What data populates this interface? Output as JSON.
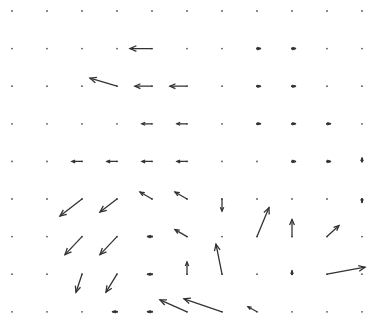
{
  "chart_data": {
    "type": "quiver",
    "title": "",
    "xlabel": "",
    "ylabel": "",
    "grid": false,
    "axes_visible": false,
    "legend": "none",
    "color": "#333333",
    "x": [
      0,
      1,
      2,
      3,
      4,
      5,
      6,
      7,
      8,
      9,
      10
    ],
    "y": [
      0,
      1,
      2,
      3,
      4,
      5,
      6,
      7,
      8
    ],
    "y_direction": "top-to-bottom",
    "vectors": [
      {
        "i": 4,
        "j": 1,
        "u": -22,
        "v": 0
      },
      {
        "i": 7,
        "j": 1,
        "u": 3,
        "v": 0
      },
      {
        "i": 8,
        "j": 1,
        "u": 3,
        "v": 0
      },
      {
        "i": 3,
        "j": 2,
        "u": -27,
        "v": 8
      },
      {
        "i": 4,
        "j": 2,
        "u": -17,
        "v": 0
      },
      {
        "i": 5,
        "j": 2,
        "u": -17,
        "v": 0
      },
      {
        "i": 7,
        "j": 2,
        "u": 3,
        "v": 0
      },
      {
        "i": 8,
        "j": 2,
        "u": 3,
        "v": 0
      },
      {
        "i": 4,
        "j": 3,
        "u": -10,
        "v": 0
      },
      {
        "i": 5,
        "j": 3,
        "u": -10,
        "v": 0
      },
      {
        "i": 7,
        "j": 3,
        "u": 3,
        "v": 0
      },
      {
        "i": 8,
        "j": 3,
        "u": 3,
        "v": 0
      },
      {
        "i": 9,
        "j": 3,
        "u": 3,
        "v": 0
      },
      {
        "i": 2,
        "j": 4,
        "u": -10,
        "v": 0
      },
      {
        "i": 3,
        "j": 4,
        "u": -10,
        "v": 0
      },
      {
        "i": 4,
        "j": 4,
        "u": -10,
        "v": 0
      },
      {
        "i": 5,
        "j": 4,
        "u": -10,
        "v": 0
      },
      {
        "i": 8,
        "j": 4,
        "u": 3,
        "v": 0
      },
      {
        "i": 9,
        "j": 4,
        "u": 3,
        "v": 0
      },
      {
        "i": 10,
        "j": 4,
        "u": 0,
        "v": 3
      },
      {
        "i": 2,
        "j": 5,
        "u": -22,
        "v": -17
      },
      {
        "i": 3,
        "j": 5,
        "u": -17,
        "v": -13
      },
      {
        "i": 4,
        "j": 5,
        "u": -12,
        "v": 7
      },
      {
        "i": 5,
        "j": 5,
        "u": -12,
        "v": 7
      },
      {
        "i": 6,
        "j": 5,
        "u": 0,
        "v": -12
      },
      {
        "i": 10,
        "j": 5,
        "u": 0,
        "v": -3
      },
      {
        "i": 2,
        "j": 6,
        "u": -17,
        "v": -18
      },
      {
        "i": 3,
        "j": 6,
        "u": -17,
        "v": -18
      },
      {
        "i": 4,
        "j": 6,
        "u": -4,
        "v": 0
      },
      {
        "i": 5,
        "j": 6,
        "u": -12,
        "v": 7
      },
      {
        "i": 7,
        "j": 6,
        "u": 12,
        "v": 29
      },
      {
        "i": 8,
        "j": 6,
        "u": 0,
        "v": 17
      },
      {
        "i": 9,
        "j": 6,
        "u": 12,
        "v": 11
      },
      {
        "i": 2,
        "j": 7,
        "u": -6,
        "v": -18
      },
      {
        "i": 3,
        "j": 7,
        "u": -11,
        "v": -18
      },
      {
        "i": 4,
        "j": 7,
        "u": -4,
        "v": 0
      },
      {
        "i": 5,
        "j": 7,
        "u": 0,
        "v": 12
      },
      {
        "i": 6,
        "j": 7,
        "u": -6,
        "v": 30
      },
      {
        "i": 8,
        "j": 7,
        "u": 0,
        "v": 3
      },
      {
        "i": 9,
        "j": 7,
        "u": 38,
        "v": 7
      },
      {
        "i": 3,
        "j": 8,
        "u": -4,
        "v": 0
      },
      {
        "i": 4,
        "j": 8,
        "u": -4,
        "v": 0
      },
      {
        "i": 5,
        "j": 8,
        "u": -27,
        "v": 12
      },
      {
        "i": 6,
        "j": 8,
        "u": -38,
        "v": 13
      },
      {
        "i": 7,
        "j": 8,
        "u": -9,
        "v": 5
      }
    ]
  }
}
